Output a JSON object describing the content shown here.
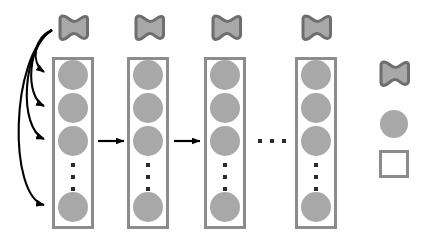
{
  "figure": {
    "background_color": "#ffffff",
    "width": 433,
    "height": 244
  },
  "colors": {
    "node_fill": "#a8a8a8",
    "shape_outline": "#6e6e6e",
    "box_border": "#8c8c8c",
    "box_fill": "#ffffff",
    "arrow": "#000000",
    "dots": "#2b2b2b"
  },
  "layers": [
    {
      "id": "layer-1",
      "index": 1,
      "flag": {
        "name": "flag-layer-1"
      },
      "box": {
        "x": 52,
        "y": 57,
        "width": 42,
        "height": 172
      },
      "nodes": [
        {
          "name": "node-1-1",
          "cx": 73,
          "cy": 75,
          "r": 15
        },
        {
          "name": "node-1-2",
          "cx": 73,
          "cy": 108,
          "r": 15
        },
        {
          "name": "node-1-3",
          "cx": 73,
          "cy": 141,
          "r": 15
        },
        {
          "name": "node-1-n",
          "cx": 73,
          "cy": 207,
          "r": 15
        }
      ],
      "ellipsis": {
        "name": "vertical-ellipsis-1",
        "x": 70,
        "y": 163,
        "height": 28
      }
    },
    {
      "id": "layer-2",
      "index": 2,
      "flag": {
        "name": "flag-layer-2"
      },
      "box": {
        "x": 127,
        "y": 57,
        "width": 42,
        "height": 172
      },
      "nodes": [
        {
          "name": "node-2-1",
          "cx": 148,
          "cy": 75,
          "r": 15
        },
        {
          "name": "node-2-2",
          "cx": 148,
          "cy": 108,
          "r": 15
        },
        {
          "name": "node-2-3",
          "cx": 148,
          "cy": 141,
          "r": 15
        },
        {
          "name": "node-2-n",
          "cx": 148,
          "cy": 207,
          "r": 15
        }
      ],
      "ellipsis": {
        "name": "vertical-ellipsis-2",
        "x": 145,
        "y": 163,
        "height": 28
      }
    },
    {
      "id": "layer-3",
      "index": 3,
      "flag": {
        "name": "flag-layer-3"
      },
      "box": {
        "x": 204,
        "y": 57,
        "width": 42,
        "height": 172
      },
      "nodes": [
        {
          "name": "node-3-1",
          "cx": 225,
          "cy": 75,
          "r": 15
        },
        {
          "name": "node-3-2",
          "cx": 225,
          "cy": 108,
          "r": 15
        },
        {
          "name": "node-3-3",
          "cx": 225,
          "cy": 141,
          "r": 15
        },
        {
          "name": "node-3-n",
          "cx": 225,
          "cy": 207,
          "r": 15
        }
      ],
      "ellipsis": {
        "name": "vertical-ellipsis-3",
        "x": 222,
        "y": 163,
        "height": 28
      }
    },
    {
      "id": "layer-4",
      "index": 4,
      "flag": {
        "name": "flag-layer-4"
      },
      "box": {
        "x": 295,
        "y": 57,
        "width": 42,
        "height": 172
      },
      "nodes": [
        {
          "name": "node-4-1",
          "cx": 316,
          "cy": 75,
          "r": 15
        },
        {
          "name": "node-4-2",
          "cx": 316,
          "cy": 108,
          "r": 15
        },
        {
          "name": "node-4-3",
          "cx": 316,
          "cy": 141,
          "r": 15
        },
        {
          "name": "node-4-n",
          "cx": 316,
          "cy": 207,
          "r": 15
        }
      ],
      "ellipsis": {
        "name": "vertical-ellipsis-4",
        "x": 313,
        "y": 163,
        "height": 28
      }
    }
  ],
  "flag_positions": [
    {
      "x": 57,
      "y": 14
    },
    {
      "x": 133,
      "y": 14
    },
    {
      "x": 210,
      "y": 14
    },
    {
      "x": 300,
      "y": 14
    }
  ],
  "forward_arrows": [
    {
      "name": "forward-arrow-1-to-2",
      "x1": 98,
      "y1": 141,
      "x2": 124,
      "y2": 141
    },
    {
      "name": "forward-arrow-2-to-3",
      "x1": 174,
      "y1": 141,
      "x2": 200,
      "y2": 141
    }
  ],
  "layer_gap_ellipsis": {
    "name": "horizontal-ellipsis-layers",
    "x": 258,
    "y": 140,
    "width": 28
  },
  "recurrent_arrows": [
    {
      "name": "recurrent-arrow-to-node-1-1",
      "path": "M 52,30 C 34,38 30,62 44,72",
      "target": "node-1-1"
    },
    {
      "name": "recurrent-arrow-to-node-1-2",
      "path": "M 52,30 C 28,42 24,96 44,106",
      "target": "node-1-2"
    },
    {
      "name": "recurrent-arrow-to-node-1-3",
      "path": "M 52,30 C 22,48 18,128 44,139",
      "target": "node-1-3"
    },
    {
      "name": "recurrent-arrow-to-node-1-n",
      "path": "M 52,30 C 10,56 8,196 44,205",
      "target": "node-1-n"
    }
  ],
  "legend": {
    "name": "legend",
    "items": [
      {
        "name": "legend-flag-symbol",
        "symbol": "flag-icon",
        "x": 378,
        "y": 60,
        "width": 32,
        "height": 30
      },
      {
        "name": "legend-circle-symbol",
        "symbol": "circle-icon",
        "x": 380,
        "y": 110,
        "width": 28,
        "height": 28
      },
      {
        "name": "legend-square-symbol",
        "symbol": "square-icon",
        "x": 379,
        "y": 150,
        "width": 30,
        "height": 28
      }
    ]
  }
}
